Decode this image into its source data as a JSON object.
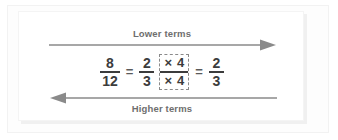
{
  "diagram": {
    "top_arrow": {
      "label": "Lower terms",
      "direction": "right",
      "icon": "arrow-right-icon"
    },
    "bottom_arrow": {
      "label": "Higher terms",
      "direction": "left",
      "icon": "arrow-left-icon"
    },
    "equation": {
      "left_fraction": {
        "numerator": "8",
        "denominator": "12"
      },
      "equals_1": "=",
      "middle_fraction": {
        "numerator": "2",
        "denominator": "3"
      },
      "multiplier_box": {
        "top_symbol": "×",
        "top_value": "4",
        "bottom_symbol": "×",
        "bottom_value": "4"
      },
      "equals_2": "=",
      "right_fraction": {
        "numerator": "2",
        "denominator": "3"
      }
    }
  },
  "colors": {
    "text": "#3c3c3c",
    "label": "#6e6e6e",
    "arrow": "#8a8a8a",
    "dashed_border": "#8a8a8a",
    "card_background": "#ffffff",
    "page_background": "#ffffff"
  }
}
